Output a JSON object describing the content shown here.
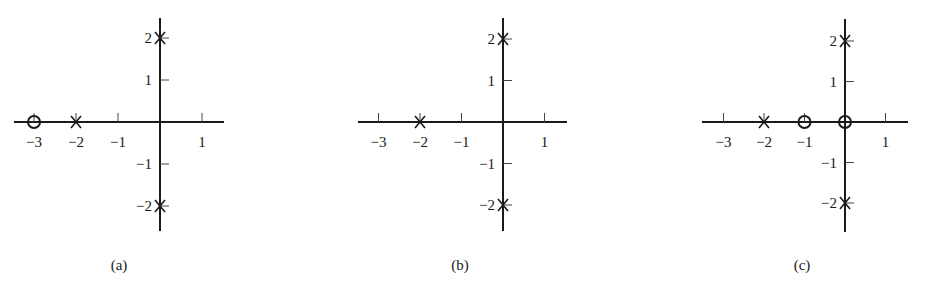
{
  "figure": {
    "pole_marker": "x",
    "zero_marker": "o"
  },
  "chart_data": [
    {
      "type": "scatter",
      "title": "",
      "caption": "(a)",
      "xlabel": "",
      "ylabel": "",
      "xlim": [
        -3.5,
        1.5
      ],
      "ylim": [
        -2.5,
        2.5
      ],
      "x_ticks": [
        -3,
        -2,
        -1,
        1
      ],
      "x_tick_labels": [
        "−3",
        "−2",
        "−1",
        "1"
      ],
      "y_ticks": [
        2,
        1,
        -1,
        -2
      ],
      "y_tick_labels": [
        "2",
        "1",
        "−1",
        "−2"
      ],
      "grid": false,
      "series": [
        {
          "name": "poles",
          "marker": "x",
          "points": [
            [
              -2,
              0
            ],
            [
              0,
              2
            ],
            [
              0,
              -2
            ]
          ]
        },
        {
          "name": "zeros",
          "marker": "o",
          "points": [
            [
              -3,
              0
            ]
          ]
        }
      ]
    },
    {
      "type": "scatter",
      "title": "",
      "caption": "(b)",
      "xlabel": "",
      "ylabel": "",
      "xlim": [
        -3.5,
        1.5
      ],
      "ylim": [
        -2.5,
        2.5
      ],
      "x_ticks": [
        -3,
        -2,
        -1,
        1
      ],
      "x_tick_labels": [
        "−3",
        "−2",
        "−1",
        "1"
      ],
      "y_ticks": [
        2,
        1,
        -1,
        -2
      ],
      "y_tick_labels": [
        "2",
        "1",
        "−1",
        "−2"
      ],
      "grid": false,
      "series": [
        {
          "name": "poles",
          "marker": "x",
          "points": [
            [
              -2,
              0
            ],
            [
              0,
              2
            ],
            [
              0,
              -2
            ]
          ]
        },
        {
          "name": "zeros",
          "marker": "o",
          "points": []
        }
      ]
    },
    {
      "type": "scatter",
      "title": "",
      "caption": "(c)",
      "xlabel": "",
      "ylabel": "",
      "xlim": [
        -3.5,
        1.5
      ],
      "ylim": [
        -2.5,
        2.5
      ],
      "x_ticks": [
        -3,
        -2,
        -1,
        1
      ],
      "x_tick_labels": [
        "−3",
        "−2",
        "−1",
        "1"
      ],
      "y_ticks": [
        2,
        1,
        -1,
        -2
      ],
      "y_tick_labels": [
        "2",
        "1",
        "−1",
        "−2"
      ],
      "grid": false,
      "series": [
        {
          "name": "poles",
          "marker": "x",
          "points": [
            [
              -2,
              0
            ],
            [
              0,
              2
            ],
            [
              0,
              -2
            ]
          ]
        },
        {
          "name": "zeros",
          "marker": "o",
          "points": [
            [
              -1,
              0
            ],
            [
              0,
              0
            ]
          ]
        }
      ]
    }
  ],
  "panels": [
    {
      "caption": "(a)",
      "origin_x": 160,
      "origin_y": 122,
      "unit": 42,
      "axis_left": 14,
      "axis_right": 224,
      "axis_top": 18,
      "axis_bottom": 231,
      "caption_x": 119
    },
    {
      "caption": "(b)",
      "origin_x": 503,
      "origin_y": 122,
      "unit": 41.5,
      "axis_left": 358,
      "axis_right": 567,
      "axis_top": 18,
      "axis_bottom": 231,
      "caption_x": 460
    },
    {
      "caption": "(c)",
      "origin_x": 845,
      "origin_y": 122,
      "unit": 40.5,
      "axis_left": 702,
      "axis_right": 908,
      "axis_top": 19,
      "axis_bottom": 232,
      "caption_x": 802
    }
  ]
}
